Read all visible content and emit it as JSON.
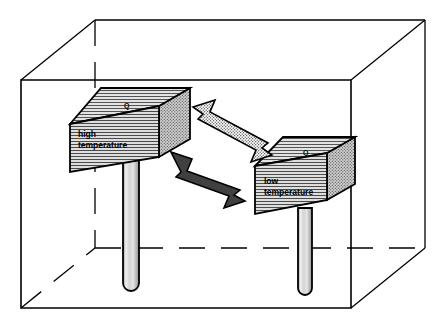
{
  "figure": {
    "background_color": "#ffffff",
    "line_color": "#000000",
    "width": 447,
    "height": 328
  },
  "enclosure": {
    "name": "outer-enclosure-box",
    "description": "transparent rectangular enclosure drawn in perspective with hidden back edges dashed",
    "stroke_color": "#000000",
    "fill_color": "none",
    "hidden_edge_style": "dashed"
  },
  "bodies": [
    {
      "id": "high",
      "label_line1": "high",
      "label_line2": "temperature",
      "heat_label": "Q",
      "top_face_fill": "#d9d9d9",
      "front_face_fill": "#d4d4d4",
      "side_face_fill": "#bdbdbd",
      "stem_fill": "#c9c9c9",
      "stroke_color": "#000000"
    },
    {
      "id": "low",
      "label_line1": "low",
      "label_line2": "temperature",
      "heat_label": "Q",
      "top_face_fill": "#d9d9d9",
      "front_face_fill": "#d4d4d4",
      "side_face_fill": "#bdbdbd",
      "stem_fill": "#c9c9c9",
      "stroke_color": "#000000"
    }
  ],
  "arrows": [
    {
      "id": "arrow-low-to-high",
      "direction": "up-left",
      "style": "stippled",
      "fill_color": "#ffffff",
      "pattern_color": "#3a3a3a",
      "stroke_color": "#000000",
      "meaning": "heat flow indicated toward high temperature body"
    },
    {
      "id": "arrow-high-to-low",
      "direction": "down-right",
      "style": "solid",
      "fill_color": "#404040",
      "stroke_color": "#000000",
      "meaning": "heat flow from high temperature body to low temperature body"
    }
  ]
}
